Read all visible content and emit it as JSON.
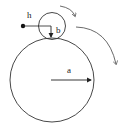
{
  "diagram": {
    "labels": {
      "h": "h",
      "b": "b",
      "a": "a"
    },
    "colors": {
      "stroke": "#333333",
      "background": "#ffffff"
    },
    "shapes": {
      "large_circle": {
        "cx": 52,
        "cy": 80,
        "r": 43
      },
      "small_circle": {
        "cx": 52,
        "cy": 26,
        "r": 14
      },
      "point_h": {
        "cx": 23,
        "cy": 26
      }
    }
  }
}
